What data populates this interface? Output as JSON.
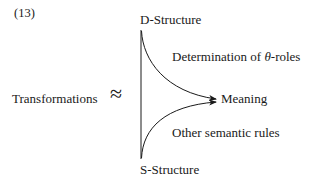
{
  "example_number": "(13)",
  "nodes": {
    "top": "D-Structure",
    "bottom": "S-Structure",
    "target": "Meaning",
    "left": "Transformations"
  },
  "relation_symbol": "≈",
  "edge_labels": {
    "top_edge_prefix": "Determination of ",
    "top_edge_symbol": "θ",
    "top_edge_suffix": "-roles",
    "bottom_edge": "Other semantic rules"
  },
  "colors": {
    "ink": "#1a1a1a",
    "background": "#ffffff"
  }
}
